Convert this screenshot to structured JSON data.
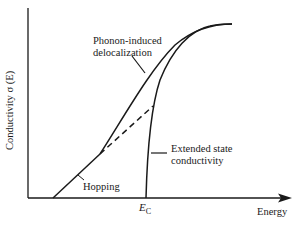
{
  "figure": {
    "y_axis_label": "Conductivity σ (E)",
    "x_axis_label": "Energy",
    "ec_label": {
      "main": "E",
      "sub": "C"
    },
    "annotations": {
      "phonon_line1": "Phonon-induced",
      "phonon_line2": "delocalization",
      "extended_line1": "Extended state",
      "extended_line2": "conductivity",
      "hopping": "Hopping"
    },
    "colors": {
      "line": "#1a1a1a",
      "background": "#ffffff"
    }
  }
}
